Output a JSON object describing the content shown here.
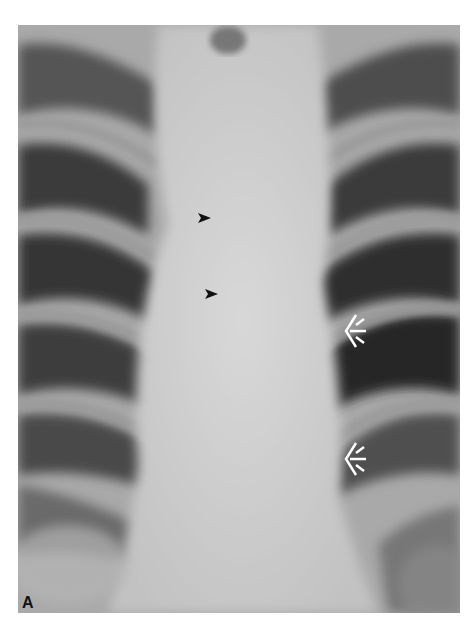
{
  "figure": {
    "panel_label": "A",
    "annotations": [
      {
        "type": "black-arrow",
        "direction": "right",
        "x": 208,
        "y": 218
      },
      {
        "type": "black-arrow",
        "direction": "right",
        "x": 215,
        "y": 294
      },
      {
        "type": "white-open-arrow",
        "direction": "left",
        "x": 353,
        "y": 331
      },
      {
        "type": "white-open-arrow",
        "direction": "left",
        "x": 353,
        "y": 458
      }
    ]
  }
}
